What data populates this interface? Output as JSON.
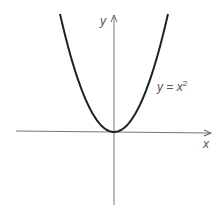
{
  "chart_data": {
    "type": "line",
    "title": "",
    "xlabel": "x",
    "ylabel": "y",
    "grid": false,
    "legend": null,
    "annotations": [
      {
        "text": "y = x",
        "superscript": "2",
        "position": "right of curve, upper middle"
      }
    ],
    "series": [
      {
        "name": "y = x^2",
        "function": "x^2",
        "x": [
          -3,
          -2.5,
          -2,
          -1.5,
          -1,
          -0.5,
          0,
          0.5,
          1,
          1.5,
          2,
          2.5,
          3
        ],
        "values": [
          9,
          6.25,
          4,
          2.25,
          1,
          0.25,
          0,
          0.25,
          1,
          2.25,
          4,
          6.25,
          9
        ]
      }
    ],
    "axes": {
      "x_ticks": [],
      "y_ticks": [],
      "x_arrow": true,
      "y_arrow": true
    },
    "colors": {
      "curve": "#222222",
      "axes": "#666666",
      "labels": "#555555"
    }
  },
  "labels": {
    "x_axis": "x",
    "y_axis": "y",
    "curve_base": "y = x",
    "curve_exp": "2"
  }
}
